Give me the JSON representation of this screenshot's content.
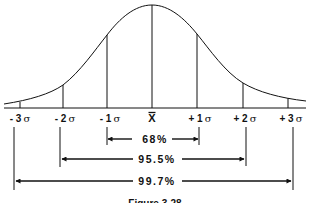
{
  "figure": {
    "caption": "Figure 3-28",
    "axis_labels": [
      {
        "sign": "- 3",
        "unit": "σ"
      },
      {
        "sign": "- 2",
        "unit": "σ"
      },
      {
        "sign": "- 1",
        "unit": "σ"
      },
      {
        "sign": "X̄",
        "unit": ""
      },
      {
        "sign": "+ 1",
        "unit": "σ"
      },
      {
        "sign": "+ 2",
        "unit": "σ"
      },
      {
        "sign": "+ 3",
        "unit": "σ"
      }
    ],
    "mean_symbol": "X",
    "ranges": [
      {
        "label": "68%",
        "from": "-1σ",
        "to": "+1σ"
      },
      {
        "label": "95.5%",
        "from": "-2σ",
        "to": "+2σ"
      },
      {
        "label": "99.7%",
        "from": "-3σ",
        "to": "+3σ"
      }
    ],
    "colors": {
      "ink": "#111111",
      "background": "#ffffff"
    }
  }
}
